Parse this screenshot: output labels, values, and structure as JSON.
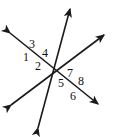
{
  "figure": {
    "kind": "geometry-diagram",
    "width": 116,
    "height": 137,
    "background_color": "#ffffff",
    "stroke_color": "#1a1a1a",
    "stroke_width": 1.6,
    "label_color": "#111111",
    "label_font_size": 12
  },
  "lines": [
    {
      "id": "line-transversal",
      "name": "transversal",
      "x1": 38,
      "y1": 128,
      "x2": 70,
      "y2": 9,
      "arrow_start": true,
      "arrow_end": true
    },
    {
      "id": "line-parallel-upper",
      "name": "upper-parallel-line",
      "x1": 10,
      "y1": 33,
      "x2": 98,
      "y2": 104,
      "arrow_start": true,
      "arrow_end": true
    },
    {
      "id": "line-parallel-lower",
      "name": "lower-parallel-line",
      "x1": 11,
      "y1": 105,
      "x2": 104,
      "y2": 35,
      "arrow_start": true,
      "arrow_end": true
    }
  ],
  "intersections": [
    {
      "id": "intersection-left",
      "x": 36,
      "y": 57
    },
    {
      "id": "intersection-right",
      "x": 74,
      "y": 83
    }
  ],
  "angle_labels": [
    {
      "id": "angle-1",
      "text": "1",
      "x": 23,
      "y": 51
    },
    {
      "id": "angle-2",
      "text": "2",
      "x": 35,
      "y": 60
    },
    {
      "id": "angle-3",
      "text": "3",
      "x": 29,
      "y": 38
    },
    {
      "id": "angle-4",
      "text": "4",
      "x": 42,
      "y": 47
    },
    {
      "id": "angle-5",
      "text": "5",
      "x": 58,
      "y": 77
    },
    {
      "id": "angle-6",
      "text": "6",
      "x": 70,
      "y": 90
    },
    {
      "id": "angle-7",
      "text": "7",
      "x": 67,
      "y": 67
    },
    {
      "id": "angle-8",
      "text": "8",
      "x": 78,
      "y": 75
    }
  ]
}
